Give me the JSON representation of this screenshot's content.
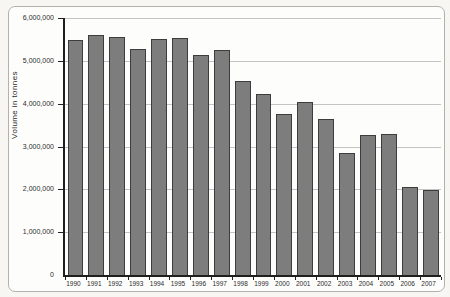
{
  "chart_data": {
    "type": "bar",
    "title": "",
    "xlabel": "",
    "ylabel": "Volume in tonnes",
    "categories": [
      "1990",
      "1991",
      "1992",
      "1993",
      "1994",
      "1995",
      "1996",
      "1997",
      "1998",
      "1999",
      "2000",
      "2001",
      "2002",
      "2003",
      "2004",
      "2005",
      "2006",
      "2007"
    ],
    "values": [
      5480000,
      5610000,
      5560000,
      5270000,
      5500000,
      5530000,
      5130000,
      5260000,
      4530000,
      4230000,
      3760000,
      4030000,
      3650000,
      2840000,
      3270000,
      3300000,
      2050000,
      1990000
    ],
    "ylim": [
      0,
      6000000
    ],
    "y_ticks": [
      0,
      1000000,
      2000000,
      3000000,
      4000000,
      5000000,
      6000000
    ],
    "y_tick_labels": [
      "0",
      "1,000,000",
      "2,000,000",
      "3,000,000",
      "4,000,000",
      "5,000,000",
      "6,000,000"
    ],
    "grid": true,
    "legend": false,
    "colors": {
      "bar_fill": "#7d7d7d",
      "bar_border": "#3d3d3d",
      "gridline": "#c4c4c4",
      "axis": "#1f1f1f",
      "text": "#2b2b2b",
      "frame_border": "#b3b1ad",
      "frame_background": "#fdfdfc"
    }
  }
}
